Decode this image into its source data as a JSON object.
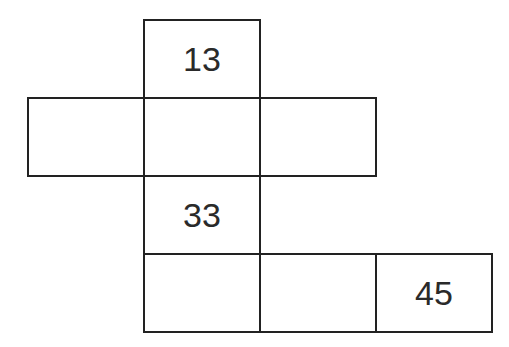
{
  "diagram": {
    "title": "",
    "cells": [
      {
        "id": "r0c1",
        "row": 0,
        "col": 1,
        "value": "13"
      },
      {
        "id": "r1c0",
        "row": 1,
        "col": 0,
        "value": ""
      },
      {
        "id": "r1c1",
        "row": 1,
        "col": 1,
        "value": ""
      },
      {
        "id": "r1c2",
        "row": 1,
        "col": 2,
        "value": ""
      },
      {
        "id": "r2c1",
        "row": 2,
        "col": 1,
        "value": "33"
      },
      {
        "id": "r3c1",
        "row": 3,
        "col": 1,
        "value": ""
      },
      {
        "id": "r3c2",
        "row": 3,
        "col": 2,
        "value": ""
      },
      {
        "id": "r3c3",
        "row": 3,
        "col": 3,
        "value": "45"
      }
    ],
    "colors": {
      "border": "#222222",
      "text": "#2a2a2a",
      "background": "#ffffff"
    }
  }
}
